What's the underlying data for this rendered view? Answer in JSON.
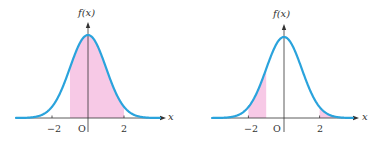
{
  "chart_data": [
    {
      "type": "area",
      "title": "",
      "description": "Standard normal density curve with shaded region between x = -1 and x = 2",
      "function": "f(x)",
      "xlabel": "x",
      "ylabel": "f(x)",
      "origin_label": "O",
      "x_ticks": [
        -2,
        2
      ],
      "tick_labels": [
        "−2",
        "2"
      ],
      "xlim": [
        -4,
        4
      ],
      "shaded_intervals": [
        [
          -1,
          2
        ]
      ],
      "curve": {
        "mean": 0,
        "sd": 1
      },
      "grid": false
    },
    {
      "type": "area",
      "title": "",
      "description": "Standard normal density curve with shaded tails between x = -2 and x = -1, and x >= 2",
      "function": "f(x)",
      "xlabel": "x",
      "ylabel": "f(x)",
      "origin_label": "O",
      "x_ticks": [
        -2,
        2
      ],
      "tick_labels": [
        "−2",
        "2"
      ],
      "xlim": [
        -4,
        4
      ],
      "shaded_intervals": [
        [
          -2,
          -1
        ],
        [
          2,
          4
        ]
      ],
      "curve": {
        "mean": 0,
        "sd": 1
      },
      "grid": false
    }
  ],
  "colors": {
    "curve": "#2aa3dc",
    "shade": "#f7c9e6",
    "axis": "#333333"
  },
  "panels": [
    {
      "ylabel": "f(x)",
      "xlabel": "x",
      "origin": "O",
      "tick_neg": "−2",
      "tick_pos": "2"
    },
    {
      "ylabel": "f(x)",
      "xlabel": "x",
      "origin": "O",
      "tick_neg": "−2",
      "tick_pos": "2"
    }
  ]
}
